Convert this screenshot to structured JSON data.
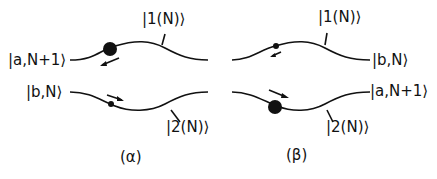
{
  "panels": [
    {
      "caption": "(α)",
      "upper_state_label": "|1(N)⟩",
      "lower_state_label": "|2(N)⟩",
      "upper_left_label": "|a,N+1⟩",
      "lower_left_label": "|b,N⟩"
    },
    {
      "caption": "(β)",
      "upper_state_label": "|1(N)⟩",
      "lower_state_label": "|2(N)⟩",
      "upper_right_label": "|b,N⟩",
      "lower_right_label": "|a,N+1⟩"
    }
  ],
  "colors": {
    "ink": "#111111",
    "background": "#ffffff"
  }
}
